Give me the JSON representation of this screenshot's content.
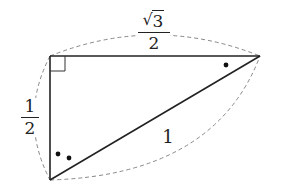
{
  "diagram": {
    "type": "right-triangle",
    "vertices": {
      "right_angle": {
        "x": 50,
        "y": 56
      },
      "right": {
        "x": 260,
        "y": 56
      },
      "bottom": {
        "x": 50,
        "y": 180
      }
    },
    "labels": {
      "top_side": {
        "numerator": "√3",
        "radicand": "3",
        "denominator": "2"
      },
      "left_side": {
        "numerator": "1",
        "denominator": "2"
      },
      "hypotenuse": "1"
    },
    "angle_marks": {
      "right_vertex": 1,
      "bottom_vertex": 2,
      "right_angle_square": true
    },
    "colors": {
      "line": "#222222",
      "dashed": "#888888",
      "background": "#ffffff"
    }
  }
}
